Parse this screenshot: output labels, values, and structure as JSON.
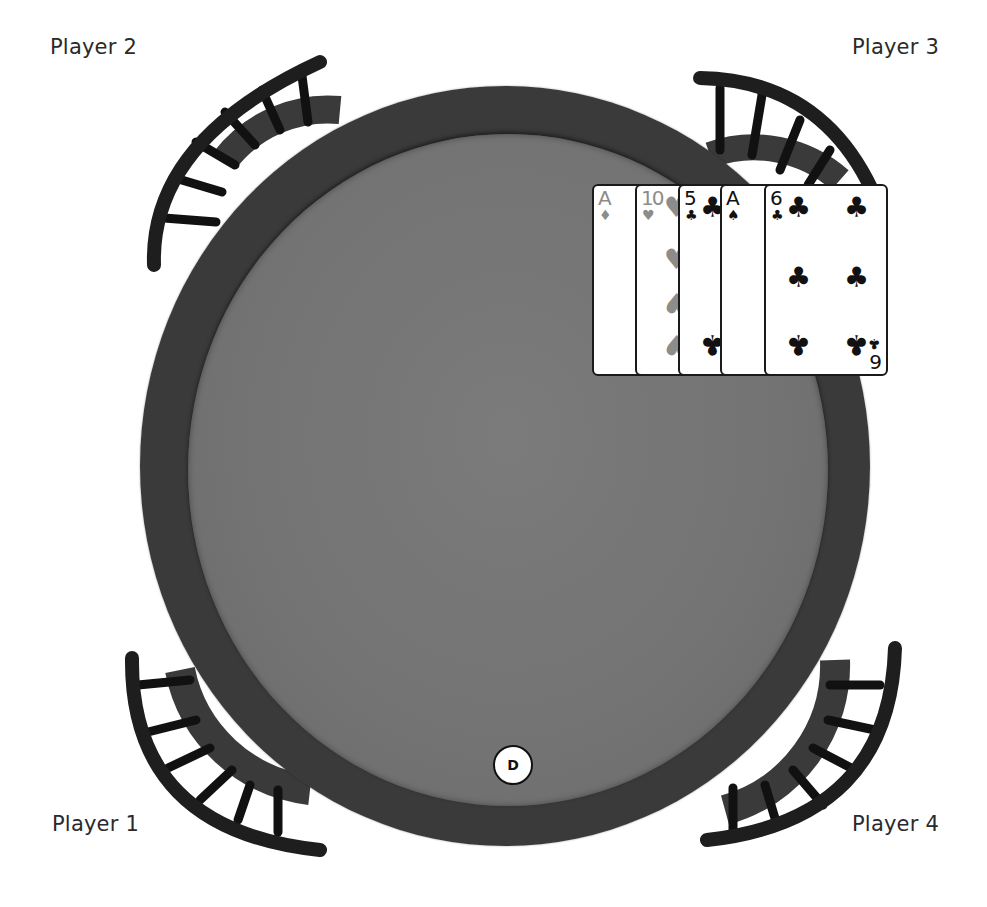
{
  "players": [
    {
      "id": "p1",
      "label": "Player 1",
      "position": "bottom-left"
    },
    {
      "id": "p2",
      "label": "Player 2",
      "position": "top-left"
    },
    {
      "id": "p3",
      "label": "Player 3",
      "position": "top-right"
    },
    {
      "id": "p4",
      "label": "Player 4",
      "position": "bottom-right"
    }
  ],
  "dealer_button": {
    "label": "D",
    "seat": "Player 1"
  },
  "hand": {
    "owner": "Player 3",
    "cards": [
      {
        "rank": "A",
        "suit": "diamonds",
        "suit_glyph": "♦",
        "color": "red"
      },
      {
        "rank": "10",
        "suit": "hearts",
        "suit_glyph": "♥",
        "color": "red"
      },
      {
        "rank": "5",
        "suit": "clubs",
        "suit_glyph": "♣",
        "color": "black"
      },
      {
        "rank": "A",
        "suit": "spades",
        "suit_glyph": "♠",
        "color": "black"
      },
      {
        "rank": "6",
        "suit": "clubs",
        "suit_glyph": "♣",
        "color": "black",
        "inverted_rank": "9"
      }
    ]
  },
  "colors": {
    "felt": "#757575",
    "rail": "#333333",
    "card_red_suit": "#8c8c8c",
    "card_black_suit": "#111111"
  }
}
